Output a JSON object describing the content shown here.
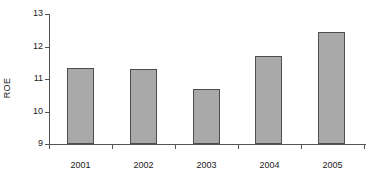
{
  "chart_data": {
    "type": "bar",
    "title": "",
    "subtitle": "",
    "xlabel": "",
    "ylabel": "ROE",
    "categories": [
      "2001",
      "2002",
      "2003",
      "2004",
      "2005"
    ],
    "values": [
      11.35,
      11.3,
      10.7,
      11.7,
      12.45
    ],
    "series": [
      {
        "name": "ROE",
        "values": [
          11.35,
          11.3,
          10.7,
          11.7,
          12.45
        ]
      }
    ],
    "ylim": [
      9,
      13
    ],
    "yticks": [
      9,
      10,
      11,
      12,
      13
    ],
    "ytick_labels": [
      "9",
      "10",
      "11",
      "12",
      "13"
    ],
    "xtick_labels": [
      "2001",
      "2002",
      "2003",
      "2004",
      "2005"
    ],
    "grid": false,
    "legend": false,
    "legend_position": "none",
    "annotations": [],
    "colors": {
      "bar_fill": "#a9a9a9",
      "bar_border": "#4d4d4d",
      "axis": "#555555",
      "text": "#1a1a1a",
      "background": "#ffffff"
    }
  }
}
